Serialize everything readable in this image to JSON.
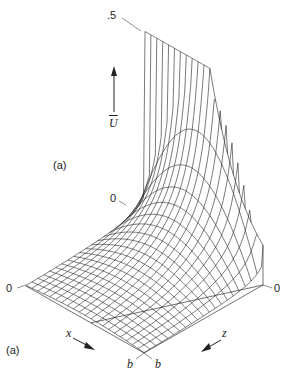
{
  "figure": {
    "panel_label_top": "(a)",
    "panel_label_bottom": "(a)",
    "line_color": "#222222",
    "background": "#ffffff"
  },
  "chart_data": {
    "type": "surface-wireframe",
    "title": "",
    "zlabel": "Ū",
    "xlabel": "x",
    "ylabel": "z",
    "ticks": {
      "u_top": ".5",
      "u_base": "0",
      "x_start": "0",
      "x_end": "b",
      "z_start": "0",
      "z_end": "b"
    },
    "u_range": [
      0,
      0.5
    ],
    "x_range": [
      0,
      1
    ],
    "z_range": [
      0,
      1
    ],
    "grid_x": 20,
    "grid_z": 20
  },
  "labels": {
    "u_top": ".5",
    "u_axis": "U",
    "u_mid_zero": "0",
    "left_zero": "0",
    "right_zero": "0",
    "x_axis": "x",
    "z_axis": "z",
    "b_left": "b",
    "b_right": "b"
  }
}
